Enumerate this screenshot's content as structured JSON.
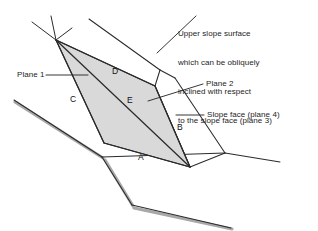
{
  "figure": {
    "background_color": "#ffffff",
    "line_color": "#2b2b2b",
    "wedge_fill_color": "#d9d9d9",
    "hatch_color": "#a8a8a8",
    "text_color": "#1d1d1d"
  },
  "annotations": {
    "upper_slope_note": "Upper slope surface\nwhich can be obliquely\ninclined with respect\nto the slope face (plane 3)",
    "upper_slope_note_lines": [
      "Upper slope surface",
      "which can be obliquely",
      "inclined with respect",
      "to the slope face (plane 3)"
    ],
    "plane1_label": "Plane 1",
    "plane2_label": "Plane 2",
    "slope_face_label": "Slope face (plane 4)"
  },
  "vertex_labels": {
    "a": "A",
    "b": "B",
    "c": "C",
    "d": "D",
    "e": "E"
  }
}
